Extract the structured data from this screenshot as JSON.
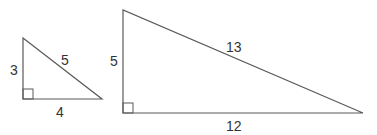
{
  "diagram": {
    "triangles": [
      {
        "name": "small",
        "legs": {
          "vertical": "3",
          "horizontal": "4"
        },
        "hypotenuse": "5",
        "right_angle": true
      },
      {
        "name": "large",
        "legs": {
          "vertical": "5",
          "horizontal": "12"
        },
        "hypotenuse": "13",
        "right_angle": true
      }
    ],
    "colors": {
      "line": "#5a5a5a",
      "text": "#333333",
      "background": "#ffffff"
    }
  }
}
